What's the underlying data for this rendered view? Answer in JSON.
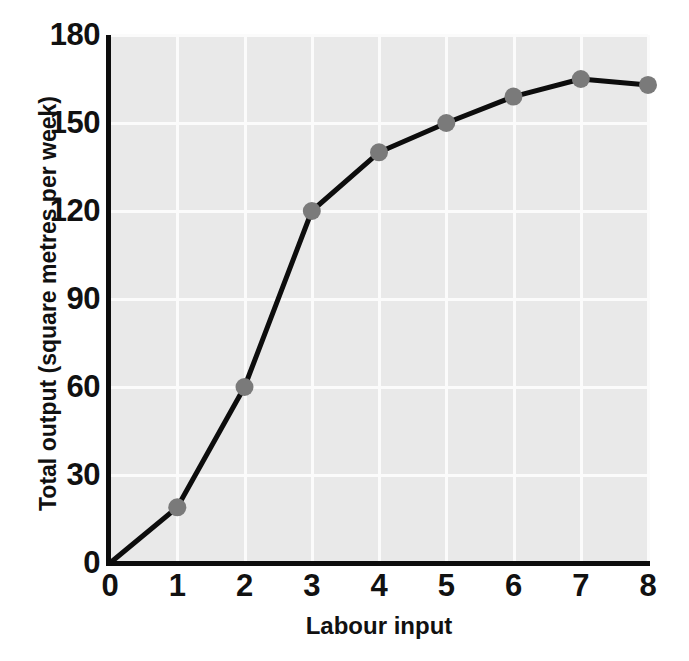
{
  "chart_data": {
    "type": "line",
    "title": "",
    "xlabel": "Labour input",
    "ylabel": "Total output (square metres per week)",
    "xlim": [
      0,
      8
    ],
    "ylim": [
      0,
      180
    ],
    "grid": true,
    "legend": "none",
    "x": [
      0,
      1,
      2,
      3,
      4,
      5,
      6,
      7,
      8
    ],
    "values": [
      0,
      19,
      60,
      120,
      140,
      150,
      159,
      165,
      163
    ],
    "markers": {
      "shown_at_x": [
        1,
        2,
        3,
        4,
        5,
        6,
        7,
        8
      ],
      "shape": "circle",
      "color": "#7a7a7a",
      "radius": 9
    },
    "line": {
      "color": "#0d0d0d",
      "width": 5
    },
    "xticks": [
      "0",
      "1",
      "2",
      "3",
      "4",
      "5",
      "6",
      "7",
      "8"
    ],
    "xtick_values": [
      0,
      1,
      2,
      3,
      4,
      5,
      6,
      7,
      8
    ],
    "yticks": [
      "0",
      "30",
      "60",
      "90",
      "120",
      "150",
      "180"
    ],
    "ytick_values": [
      0,
      30,
      60,
      90,
      120,
      150,
      180
    ],
    "plot_background": "#e9e9e9",
    "gridline_color": "#fbfbfb",
    "axis_color": "#0d0d0d",
    "figure_background": "#ffffff"
  }
}
